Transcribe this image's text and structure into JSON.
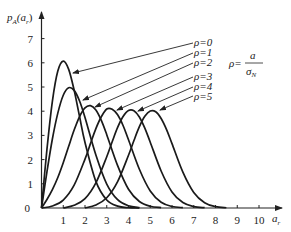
{
  "chart_data": {
    "type": "line",
    "title": "",
    "xlabel": "a_r",
    "ylabel": "p_A(a_r)",
    "xlim": [
      0,
      10.9
    ],
    "ylim": [
      0,
      7.8
    ],
    "grid": false,
    "x_ticks": [
      "1",
      "2",
      "3",
      "4",
      "5",
      "6",
      "7",
      "8",
      "9",
      "10"
    ],
    "y_ticks": [
      "0",
      "1",
      "2",
      "3",
      "4",
      "5",
      "6",
      "7"
    ],
    "annotation": {
      "lhs": "ρ=",
      "numerator": "a",
      "denominator": "σ",
      "denominator_sub": "N"
    },
    "legend_position": "right, with arrows pointing to curves",
    "series": [
      {
        "name": "ρ=0",
        "label": "ρ=0",
        "x": [
          0,
          0.25,
          0.5,
          0.75,
          1,
          1.25,
          1.5,
          1.75,
          2,
          2.5,
          3,
          3.5,
          4,
          4.5
        ],
        "y": [
          0,
          2.42,
          4.41,
          5.66,
          6.07,
          5.73,
          4.87,
          3.78,
          2.71,
          1.1,
          0.33,
          0.076,
          0.013,
          0.002
        ]
      },
      {
        "name": "ρ=1",
        "label": "ρ=1",
        "x": [
          0,
          0.25,
          0.5,
          0.75,
          1,
          1.25,
          1.5,
          1.75,
          2,
          2.5,
          3,
          3.5,
          4,
          4.5
        ],
        "y": [
          0,
          1.49,
          2.85,
          3.92,
          4.66,
          4.97,
          4.86,
          4.42,
          3.74,
          2.19,
          0.99,
          0.342,
          0.092,
          0.019
        ]
      },
      {
        "name": "ρ=2",
        "label": "ρ=2",
        "x": [
          0,
          0.25,
          0.5,
          0.75,
          1,
          1.25,
          1.5,
          1.75,
          2,
          2.25,
          2.5,
          2.75,
          3,
          3.5,
          4,
          4.5,
          5,
          5.5
        ],
        "y": [
          0,
          0.349,
          0.756,
          1.26,
          1.87,
          2.55,
          3.22,
          3.78,
          4.14,
          4.23,
          4.05,
          3.62,
          3.03,
          1.75,
          0.776,
          0.269,
          0.071,
          0.015
        ]
      },
      {
        "name": "ρ=3",
        "label": "ρ=3",
        "x": [
          0,
          0.5,
          1,
          1.5,
          2,
          2.25,
          2.5,
          2.75,
          3,
          3.25,
          3.5,
          3.75,
          4,
          4.5,
          5,
          5.5,
          6,
          6.5
        ],
        "y": [
          0,
          0.081,
          0.329,
          0.946,
          2.02,
          2.66,
          3.28,
          3.77,
          4.09,
          4.08,
          3.85,
          3.41,
          2.82,
          1.6,
          0.704,
          0.239,
          0.063,
          0.013
        ]
      },
      {
        "name": "ρ=4",
        "label": "ρ=4",
        "x": [
          1,
          1.5,
          2,
          2.5,
          3,
          3.25,
          3.5,
          3.75,
          4,
          4.25,
          4.5,
          4.75,
          5,
          5.5,
          6,
          6.5,
          7,
          7.5
        ],
        "y": [
          0,
          0.11,
          0.388,
          1.04,
          2.12,
          2.74,
          3.33,
          3.78,
          4.03,
          4.02,
          3.76,
          3.3,
          2.72,
          1.53,
          0.664,
          0.224,
          0.059,
          0.012
        ]
      },
      {
        "name": "ρ=5",
        "label": "ρ=5",
        "x": [
          2,
          2.5,
          3,
          3.5,
          4,
          4.25,
          4.5,
          4.75,
          5,
          5.25,
          5.5,
          5.75,
          6,
          6.5,
          7,
          7.5,
          8,
          8.5
        ],
        "y": [
          0,
          0.125,
          0.422,
          1.09,
          2.18,
          2.79,
          3.36,
          3.79,
          4.01,
          3.98,
          3.7,
          3.24,
          2.66,
          1.48,
          0.641,
          0.215,
          0.056,
          0.011
        ]
      }
    ],
    "arrows": [
      {
        "from": [
          193,
          43
        ],
        "to": [
          73,
          73
        ]
      },
      {
        "from": [
          193,
          53
        ],
        "to": [
          83,
          100
        ]
      },
      {
        "from": [
          193,
          63
        ],
        "to": [
          95,
          107
        ]
      },
      {
        "from": [
          193,
          77
        ],
        "to": [
          117,
          110
        ]
      },
      {
        "from": [
          193,
          87
        ],
        "to": [
          138,
          111
        ]
      },
      {
        "from": [
          193,
          96
        ],
        "to": [
          160,
          110
        ]
      }
    ]
  },
  "layout": {
    "x0": 41.5,
    "x_unit": 21.75,
    "y0": 208,
    "y_unit": 24.2,
    "label_x": 194,
    "label_y": [
      46,
      56,
      66,
      80,
      90,
      100
    ]
  }
}
